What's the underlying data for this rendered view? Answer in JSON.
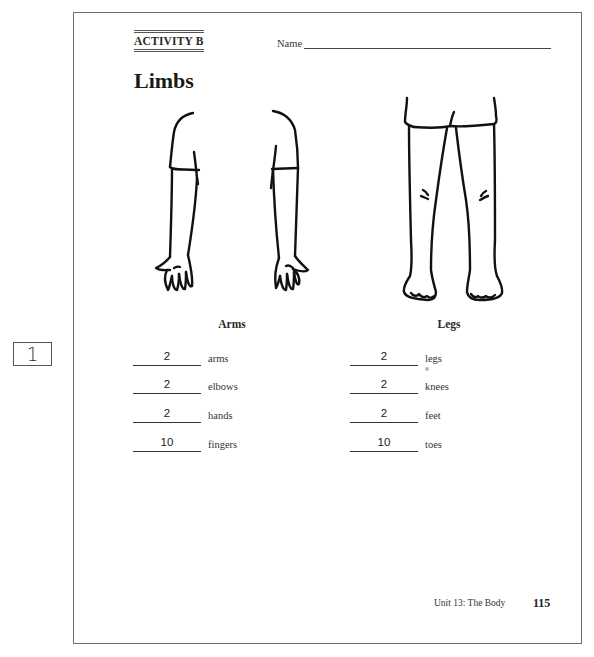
{
  "side_marker": {
    "number": "1"
  },
  "header": {
    "activity_label": "ACTIVITY B",
    "name_label": "Name",
    "name_value": ""
  },
  "title": "Limbs",
  "illustrations": {
    "arms": {
      "icon": "arms-illustration",
      "description": "Left and right arms with short sleeves, front view"
    },
    "legs": {
      "icon": "legs-illustration",
      "description": "Pair of legs wearing shorts, front view"
    }
  },
  "sections": [
    {
      "heading": "Arms",
      "rows": [
        {
          "answer": "2",
          "label": "arms"
        },
        {
          "answer": "2",
          "label": "elbows"
        },
        {
          "answer": "2",
          "label": "hands"
        },
        {
          "answer": "10",
          "label": "fingers"
        }
      ]
    },
    {
      "heading": "Legs",
      "rows": [
        {
          "answer": "2",
          "label": "legs"
        },
        {
          "answer": "2",
          "label": "knees"
        },
        {
          "answer": "2",
          "label": "feet"
        },
        {
          "answer": "10",
          "label": "toes"
        }
      ]
    }
  ],
  "footer": {
    "unit": "Unit 13: The Body",
    "page_number": "115"
  }
}
